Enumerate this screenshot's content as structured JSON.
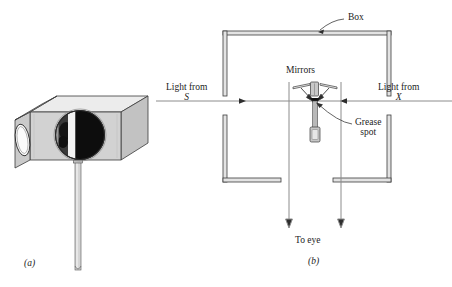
{
  "figure": {
    "panel_a": {
      "tag": "(a)",
      "parts": {
        "box": "grease-spot-photometer-box",
        "front_aperture": "circular-viewing-window",
        "side_aperture": "elliptical-side-hole",
        "stand": "vertical-support-rod"
      }
    },
    "panel_b": {
      "tag": "(b)",
      "labels": {
        "box": "Box",
        "mirrors": "Mirrors",
        "grease_spot_line1": "Grease",
        "grease_spot_line2": "spot",
        "light_from_s_line1": "Light from",
        "light_from_s_line2": "S",
        "light_from_x_line1": "Light from",
        "light_from_x_line2": "X",
        "to_eye": "To eye"
      },
      "rays": {
        "incoming_left_direction": "rightward",
        "incoming_right_direction": "leftward",
        "outgoing_direction": "downward"
      }
    }
  },
  "colors": {
    "ink": "#1c1c1c",
    "ray": "#8a8a8a",
    "wall_fill": "#d9d9d9",
    "box_top": "#e8e8e8",
    "box_front": "#cfcfcf",
    "box_side": "#bdbdbd",
    "disc_dark": "#141414",
    "disc_light": "#f2f2f2"
  }
}
